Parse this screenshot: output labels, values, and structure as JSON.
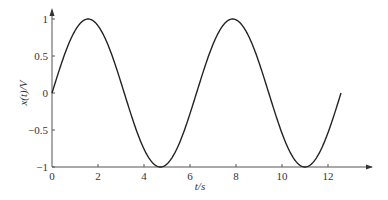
{
  "chart_data": {
    "type": "line",
    "title": "",
    "xlabel": "t/s",
    "ylabel": "x(t)/V",
    "xlim": [
      0,
      13.5
    ],
    "ylim": [
      -1,
      1.1
    ],
    "x_ticks": [
      "0",
      "2",
      "4",
      "6",
      "8",
      "10",
      "12"
    ],
    "y_ticks": [
      "-1",
      "-0.5",
      "0",
      "0.5",
      "1"
    ],
    "grid": false,
    "legend": null,
    "series": [
      {
        "name": "x(t) = sin(t)",
        "x": [
          0,
          1.5708,
          3.1416,
          4.7124,
          6.2832,
          7.854,
          9.4248,
          10.9956,
          12.5664
        ],
        "y": [
          0,
          1,
          0,
          -1,
          0,
          1,
          0,
          -1,
          0
        ],
        "color": "#222222"
      }
    ]
  }
}
